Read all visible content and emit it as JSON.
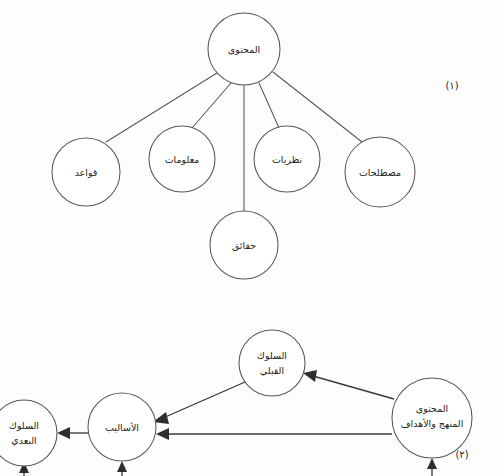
{
  "document": {
    "language": "ar",
    "background_color": "#fdfdfd",
    "stroke_color": "#58585c",
    "text_color": "#1d1d20"
  },
  "figure_one": {
    "caption": "(١)",
    "type": "radial-tree",
    "root": {
      "id": "content-root",
      "label": "المحتوى",
      "cx": 244,
      "cy": 49,
      "r": 36,
      "font_size": 9.5
    },
    "children": [
      {
        "id": "rules",
        "label": "قواعد",
        "cx": 86,
        "cy": 172,
        "r": 34,
        "font_size": 9.5
      },
      {
        "id": "information",
        "label": "معلومات",
        "cx": 182,
        "cy": 159,
        "r": 33,
        "font_size": 9.5
      },
      {
        "id": "facts",
        "label": "حقائق",
        "cx": 244,
        "cy": 245,
        "r": 34,
        "font_size": 9.5
      },
      {
        "id": "theories",
        "label": "نظريات",
        "cx": 287,
        "cy": 159,
        "r": 33,
        "font_size": 9.5
      },
      {
        "id": "terminology",
        "label": "مصطلحات",
        "cx": 380,
        "cy": 172,
        "r": 35,
        "font_size": 9.5
      }
    ],
    "edges": [
      {
        "from": "content-root",
        "to": "rules"
      },
      {
        "from": "content-root",
        "to": "information"
      },
      {
        "from": "content-root",
        "to": "facts"
      },
      {
        "from": "content-root",
        "to": "theories"
      },
      {
        "from": "content-root",
        "to": "terminology"
      }
    ]
  },
  "figure_two": {
    "caption": "(٢)",
    "type": "flow-diagram",
    "nodes": [
      {
        "id": "prior-behavior",
        "label_lines": [
          "السلوك",
          "القبلي"
        ],
        "cx": 272,
        "cy": 363,
        "r": 33,
        "font_size": 9.5
      },
      {
        "id": "content-curriculum-objectives",
        "label_lines": [
          "المحتوى",
          "المنهج والأهداف"
        ],
        "cx": 432,
        "cy": 418,
        "r": 40,
        "font_size": 9.5
      },
      {
        "id": "methods",
        "label_lines": [
          "الأساليب"
        ],
        "cx": 122,
        "cy": 427,
        "r": 34,
        "font_size": 9.5
      },
      {
        "id": "post-behavior",
        "label_lines": [
          "السلوك",
          "البعدي"
        ],
        "cx": 24,
        "cy": 433,
        "r": 33,
        "font_size": 9.5
      }
    ],
    "arrows": [
      {
        "id": "source-to-prior",
        "from": "content-curriculum-objectives",
        "to": "prior-behavior"
      },
      {
        "id": "prior-to-methods",
        "from": "prior-behavior",
        "to": "methods"
      },
      {
        "id": "source-to-methods",
        "from": "content-curriculum-objectives",
        "to": "methods"
      },
      {
        "id": "methods-to-post",
        "from": "methods",
        "to": "post-behavior"
      }
    ],
    "feedback_arrows": [
      {
        "id": "feedback-post-behavior",
        "target": "post-behavior",
        "x": 24
      },
      {
        "id": "feedback-methods",
        "target": "methods",
        "x": 122
      },
      {
        "id": "feedback-source",
        "target": "content-curriculum-objectives",
        "x": 432
      }
    ]
  }
}
